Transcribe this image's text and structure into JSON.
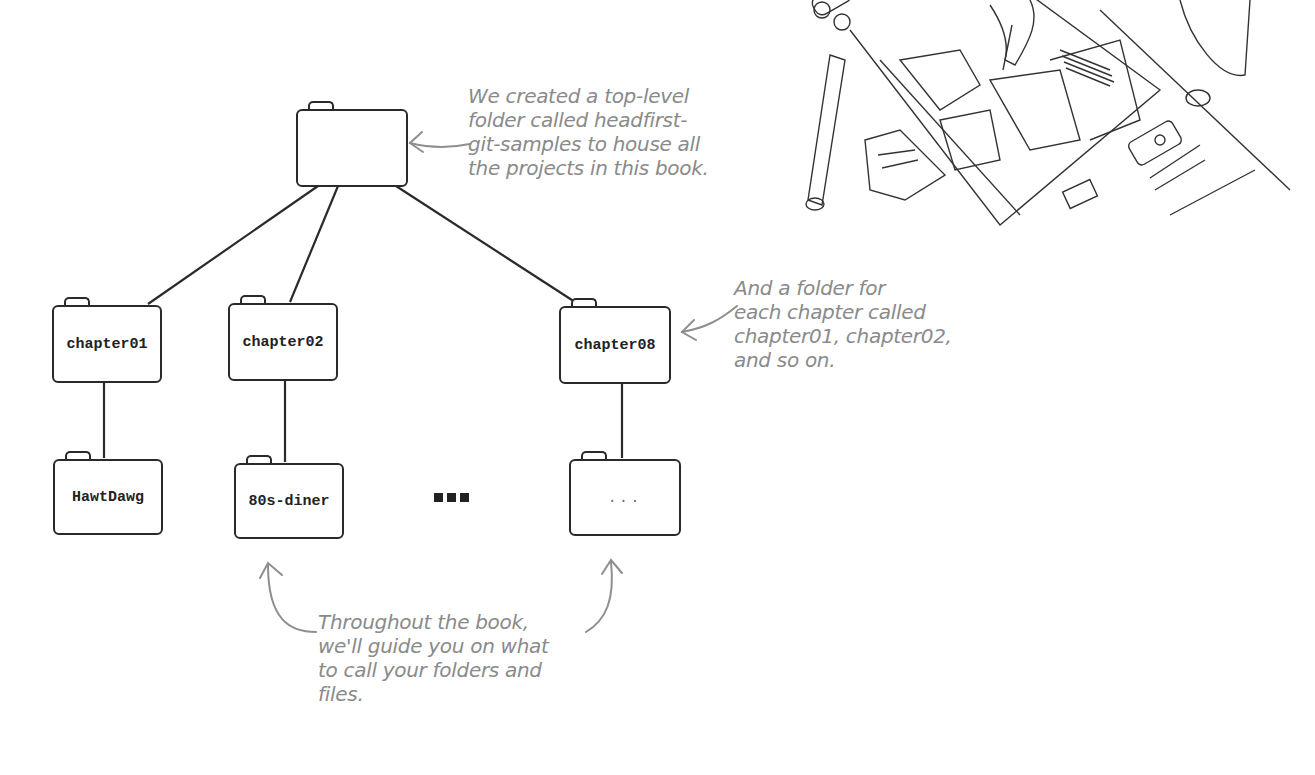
{
  "diagram": {
    "type": "folder-tree",
    "root": {
      "label": "",
      "represents": "headfirst-git-samples"
    },
    "chapters": [
      {
        "label": "chapter01",
        "child": "HawtDawg"
      },
      {
        "label": "chapter02",
        "child": "80s-diner"
      },
      {
        "label": "chapter08",
        "child": "..."
      }
    ],
    "ellipsis": "■■■"
  },
  "annotations": {
    "root_note": "We created a top-level\nfolder called headfirst-\ngit-samples to house all\nthe projects in this book.",
    "chapter_note": "And a folder for\neach chapter called\nchapter01, chapter02,\nand so on.",
    "bottom_note": "Throughout the book,\nwe'll guide you on what\nto call your folders and\nfiles."
  },
  "illustration": {
    "description": "Pencil sketch of a person drawing architectural floor plans on a desk",
    "visible_room_labels": [
      "NOOK",
      "FOYER",
      "GREAT RM",
      "GARAGE",
      "MASTER"
    ]
  },
  "colors": {
    "line": "#2a2a2a",
    "annotation_text": "#8a8a8a",
    "background": "#ffffff"
  }
}
